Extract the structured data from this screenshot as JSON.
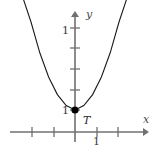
{
  "figure": {
    "kind": "cartesian-plot",
    "width": 160,
    "height": 158,
    "background": "#ffffff"
  },
  "axes": {
    "x": {
      "name": "x",
      "color": "#707070",
      "line_y": 132,
      "start_x": 10,
      "end_x": 150,
      "arrow": "right",
      "ticks": [
        -2,
        -1,
        1,
        2
      ],
      "tick_pixels": [
        32,
        54,
        97,
        118
      ],
      "labeled_tick": "1",
      "labeled_tick_value": 1
    },
    "y": {
      "name": "y",
      "color": "#707070",
      "line_x": 75,
      "start_y": 12,
      "end_y": 142,
      "arrow": "up",
      "ticks": [
        1,
        2,
        3,
        4,
        5
      ],
      "tick_pixels": [
        110,
        90,
        69,
        48,
        28
      ],
      "labeled_ticks": [
        "1",
        "1"
      ],
      "labeled_tick_top": "1",
      "labeled_tick_bottom": "1"
    }
  },
  "chart_data": {
    "type": "line",
    "title": "",
    "subtitle": "",
    "xlabel": "x",
    "ylabel": "y",
    "xlim": [
      -3,
      3.5
    ],
    "ylim": [
      -0.6,
      6.2
    ],
    "grid": false,
    "legend": null,
    "curve": {
      "name": "parabola",
      "equation": "y = a(x - h)^2 + k",
      "color": "#1a1a1a",
      "stroke_width": 1,
      "vertex": [
        0,
        1
      ],
      "x": [
        -2.4,
        -2.0,
        -1.6,
        -1.2,
        -0.8,
        -0.4,
        0.0,
        0.4,
        0.8,
        1.2,
        1.6,
        2.0,
        2.4
      ],
      "y": [
        6.2,
        5.0,
        3.6,
        2.5,
        1.7,
        1.2,
        1.0,
        1.2,
        1.7,
        2.5,
        3.6,
        5.0,
        6.2
      ]
    },
    "points": [
      {
        "label": "T",
        "x": 0,
        "y": 1,
        "marker": "filled-circle",
        "color": "#000000",
        "radius": 3.6,
        "pixel_x": 75,
        "pixel_y": 110
      }
    ],
    "annotations": [
      {
        "text": "1",
        "role": "y-tick-label-upper"
      },
      {
        "text": "1",
        "role": "y-tick-label-at-vertex"
      },
      {
        "text": "1",
        "role": "x-tick-label"
      },
      {
        "text": "T",
        "role": "point-label"
      },
      {
        "text": "y",
        "role": "y-axis-name"
      },
      {
        "text": "x",
        "role": "x-axis-name"
      }
    ]
  },
  "labels": {
    "axis_x": "x",
    "axis_y": "y",
    "y_tick_upper": "1",
    "y_tick_vertex": "1",
    "x_tick": "1",
    "point_t": "T"
  },
  "colors": {
    "axis": "#707070",
    "curve": "#1a1a1a",
    "point": "#000000",
    "text": "#3b3b3b",
    "background": "#ffffff"
  }
}
